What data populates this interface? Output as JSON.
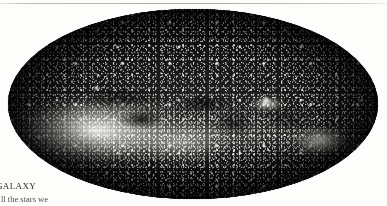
{
  "page": {
    "background_color": "#fdfdfc",
    "width": 387,
    "height": 206
  },
  "rule": {
    "name": "top-horizontal-rule",
    "color": "#bdbdbb"
  },
  "figure": {
    "name": "milky-way-all-sky-panorama",
    "projection": "elliptical all-sky (Aitoff/Hammer)",
    "background_color": "#050505",
    "star_color": "#ffffff",
    "features": [
      {
        "label": "galactic-bulge-glow"
      },
      {
        "label": "galactic-plane-band"
      },
      {
        "label": "dust-lane"
      },
      {
        "label": "bright-cluster-knot"
      },
      {
        "label": "magellanic-patch"
      }
    ]
  },
  "caption": {
    "heading": "GALAXY",
    "body": "ll the stars we"
  }
}
